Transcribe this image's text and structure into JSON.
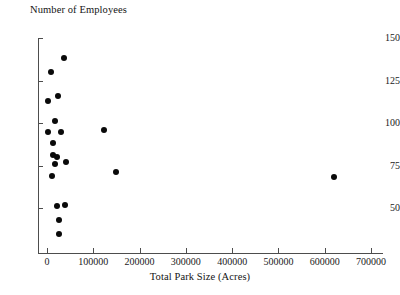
{
  "chart_data": {
    "type": "scatter",
    "title": "",
    "ylabel": "Number of Employees",
    "xlabel": "Total Park Size (Acres)",
    "xlim": [
      -20000,
      715000
    ],
    "ylim": [
      23,
      150
    ],
    "grid": false,
    "legend": null,
    "xticks": [
      0,
      100000,
      200000,
      300000,
      400000,
      500000,
      600000,
      700000
    ],
    "xtick_labels": [
      "0",
      "100000",
      "200000",
      "300000",
      "400000",
      "500000",
      "600000",
      "700000"
    ],
    "yticks": [
      50,
      75,
      100,
      125,
      150
    ],
    "ytick_labels": [
      "50",
      "75",
      "100",
      "125",
      "150"
    ],
    "marker": "filled-circle",
    "marker_color": "#0a0a0a",
    "points": [
      {
        "x": 36000,
        "y": 138
      },
      {
        "x": 9000,
        "y": 130
      },
      {
        "x": 24000,
        "y": 116
      },
      {
        "x": 3000,
        "y": 113
      },
      {
        "x": 17000,
        "y": 101
      },
      {
        "x": 123000,
        "y": 96
      },
      {
        "x": 30000,
        "y": 95
      },
      {
        "x": 1500,
        "y": 95
      },
      {
        "x": 13000,
        "y": 88
      },
      {
        "x": 12000,
        "y": 81
      },
      {
        "x": 22000,
        "y": 80
      },
      {
        "x": 40000,
        "y": 77
      },
      {
        "x": 18000,
        "y": 76
      },
      {
        "x": 150000,
        "y": 71
      },
      {
        "x": 10000,
        "y": 69
      },
      {
        "x": 38000,
        "y": 52
      },
      {
        "x": 21000,
        "y": 51
      },
      {
        "x": 26000,
        "y": 43
      },
      {
        "x": 25000,
        "y": 35
      },
      {
        "x": 620000,
        "y": 68
      }
    ]
  },
  "axes": {
    "y_title": "Number of Employees",
    "x_title": "Total Park Size (Acres)"
  }
}
